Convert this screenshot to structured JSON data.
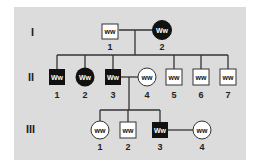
{
  "diagram": {
    "type": "pedigree",
    "generations": [
      {
        "label": "I",
        "individuals": [
          {
            "id": "1",
            "sex": "male",
            "affected": false,
            "genotype": "ww"
          },
          {
            "id": "2",
            "sex": "female",
            "affected": true,
            "genotype": "Ww"
          }
        ]
      },
      {
        "label": "II",
        "individuals": [
          {
            "id": "1",
            "sex": "male",
            "affected": true,
            "genotype": "Ww"
          },
          {
            "id": "2",
            "sex": "female",
            "affected": true,
            "genotype": "Ww"
          },
          {
            "id": "3",
            "sex": "male",
            "affected": true,
            "genotype": "Ww"
          },
          {
            "id": "4",
            "sex": "female",
            "affected": false,
            "genotype": "ww"
          },
          {
            "id": "5",
            "sex": "male",
            "affected": false,
            "genotype": "ww"
          },
          {
            "id": "6",
            "sex": "male",
            "affected": false,
            "genotype": "ww"
          },
          {
            "id": "7",
            "sex": "male",
            "affected": false,
            "genotype": "ww"
          }
        ]
      },
      {
        "label": "III",
        "individuals": [
          {
            "id": "1",
            "sex": "female",
            "affected": false,
            "genotype": "ww"
          },
          {
            "id": "2",
            "sex": "male",
            "affected": false,
            "genotype": "ww"
          },
          {
            "id": "3",
            "sex": "male",
            "affected": true,
            "genotype": "Ww"
          },
          {
            "id": "4",
            "sex": "female",
            "affected": false,
            "genotype": "ww"
          }
        ]
      }
    ],
    "colors": {
      "background": "#dcdcdc",
      "affected": "#111111",
      "unaffected": "#ffffff",
      "line": "#333333"
    }
  }
}
